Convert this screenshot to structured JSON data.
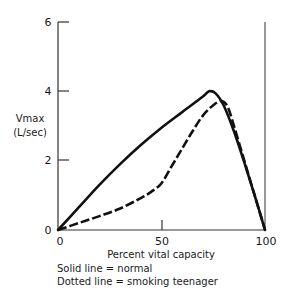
{
  "chart_data": {
    "type": "line",
    "title": "",
    "xlabel": "Percent vital capacity",
    "ylabel": "Vmax (L/sec)",
    "ylabel_lines": [
      "Vmax",
      "(L/sec)"
    ],
    "xlim": [
      0,
      100
    ],
    "ylim": [
      0,
      6
    ],
    "x_ticks": [
      "0",
      "50",
      "100"
    ],
    "y_ticks": [
      "0",
      "2",
      "4",
      "6"
    ],
    "grid": false,
    "series": [
      {
        "name": "normal",
        "style": "solid",
        "x": [
          0,
          10,
          20,
          30,
          40,
          50,
          60,
          70,
          73,
          76,
          80,
          85,
          90,
          95,
          100
        ],
        "y": [
          0,
          0.65,
          1.3,
          1.9,
          2.45,
          2.95,
          3.4,
          3.85,
          4.0,
          3.95,
          3.6,
          2.85,
          1.95,
          1.0,
          0
        ]
      },
      {
        "name": "smoking teenager",
        "style": "dashed",
        "x": [
          0,
          10,
          20,
          30,
          40,
          45,
          50,
          55,
          60,
          65,
          70,
          75,
          79,
          82,
          85,
          90,
          95,
          100
        ],
        "y": [
          0,
          0.2,
          0.4,
          0.62,
          0.92,
          1.1,
          1.35,
          1.85,
          2.35,
          2.85,
          3.3,
          3.6,
          3.72,
          3.55,
          3.0,
          2.0,
          1.0,
          0
        ]
      }
    ],
    "annotations": [
      "Solid line = normal",
      "Dotted line = smoking teenager"
    ]
  },
  "axes": {
    "x_tick_labels": [
      "0",
      "50",
      "100"
    ],
    "y_tick_labels": [
      "0",
      "2",
      "4",
      "6"
    ],
    "x_title": "Percent vital capacity",
    "y_title_line1": "Vmax",
    "y_title_line2": "(L/sec)"
  },
  "legend": {
    "solid": "Solid line = normal",
    "dotted": "Dotted line = smoking teenager"
  }
}
